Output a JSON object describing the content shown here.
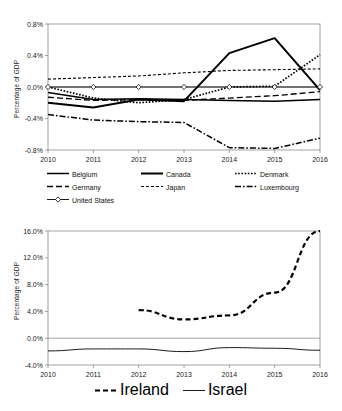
{
  "figure": {
    "background": "#ffffff",
    "line_color": "#000000",
    "axis_color": "#808080"
  },
  "charts": [
    {
      "id": "top",
      "ylabel": "Percentage of GDP",
      "yticks": [
        "0.8%",
        "0.4%",
        "0.0%",
        "-0.4%",
        "-0.8%"
      ],
      "xticks": [
        "2010",
        "2011",
        "2012",
        "2013",
        "2014",
        "2015",
        "2016"
      ],
      "legend": [
        {
          "label": "Belgium",
          "style": "solid"
        },
        {
          "label": "Canada",
          "style": "solid-thick"
        },
        {
          "label": "Denmark",
          "style": "dotted"
        },
        {
          "label": "Germany",
          "style": "dashed"
        },
        {
          "label": "Japan",
          "style": "fine-dashed"
        },
        {
          "label": "Luxembourg",
          "style": "dash-dot"
        },
        {
          "label": "United States",
          "style": "solid-marker"
        }
      ]
    },
    {
      "id": "bottom",
      "ylabel": "Percentage of GDP",
      "yticks": [
        "16.0%",
        "12.0%",
        "8.0%",
        "4.0%",
        "0.0%",
        "-4.0%"
      ],
      "xticks": [
        "2010",
        "2011",
        "2012",
        "2013",
        "2014",
        "2015",
        "2016"
      ],
      "legend": [
        {
          "label": "Ireland",
          "style": "heavy-dashed"
        },
        {
          "label": "Israel",
          "style": "thin-solid"
        }
      ]
    }
  ],
  "chart_data": [
    {
      "type": "line",
      "title": "",
      "xlabel": "",
      "ylabel": "Percentage of GDP",
      "x": [
        2010,
        2011,
        2012,
        2013,
        2014,
        2015,
        2016
      ],
      "xlim": [
        2010,
        2016
      ],
      "ylim": [
        -0.8,
        0.8
      ],
      "ytick_values": [
        0.8,
        0.4,
        0.0,
        -0.4,
        -0.8
      ],
      "ytick_labels": [
        "0.8%",
        "0.4%",
        "0.0%",
        "-0.4%",
        "-0.8%"
      ],
      "xtick_labels": [
        "2010",
        "2011",
        "2012",
        "2013",
        "2014",
        "2015",
        "2016"
      ],
      "grid": false,
      "legend_position": "below",
      "series": [
        {
          "name": "Belgium",
          "style": "solid",
          "values": [
            -0.07,
            -0.16,
            -0.15,
            -0.16,
            -0.17,
            -0.18,
            -0.16
          ]
        },
        {
          "name": "Canada",
          "style": "solid-thick",
          "values": [
            -0.2,
            -0.26,
            -0.16,
            -0.18,
            0.43,
            0.62,
            -0.04
          ]
        },
        {
          "name": "Denmark",
          "style": "dotted",
          "values": [
            0.0,
            -0.14,
            -0.2,
            -0.16,
            0.0,
            0.01,
            0.41
          ]
        },
        {
          "name": "Germany",
          "style": "dashed",
          "values": [
            -0.13,
            -0.17,
            -0.16,
            -0.17,
            -0.14,
            -0.11,
            -0.06
          ]
        },
        {
          "name": "Japan",
          "style": "fine-dashed",
          "values": [
            0.1,
            0.12,
            0.14,
            0.18,
            0.21,
            0.22,
            0.23
          ]
        },
        {
          "name": "Luxembourg",
          "style": "dash-dot",
          "values": [
            -0.35,
            -0.42,
            -0.44,
            -0.45,
            -0.77,
            -0.78,
            -0.65
          ]
        },
        {
          "name": "United States",
          "style": "solid-marker",
          "values": [
            0.0,
            0.0,
            0.0,
            0.0,
            0.0,
            0.0,
            0.0
          ]
        }
      ]
    },
    {
      "type": "line",
      "title": "",
      "xlabel": "",
      "ylabel": "Percentage of GDP",
      "x": [
        2010,
        2011,
        2012,
        2013,
        2014,
        2015,
        2016
      ],
      "xlim": [
        2010,
        2016
      ],
      "ylim": [
        -4.0,
        16.0
      ],
      "ytick_values": [
        16.0,
        12.0,
        8.0,
        4.0,
        0.0,
        -4.0
      ],
      "ytick_labels": [
        "16.0%",
        "12.0%",
        "8.0%",
        "4.0%",
        "0.0%",
        "-4.0%"
      ],
      "xtick_labels": [
        "2010",
        "2011",
        "2012",
        "2013",
        "2014",
        "2015",
        "2016"
      ],
      "grid": false,
      "legend_position": "below",
      "series": [
        {
          "name": "Ireland",
          "style": "heavy-dashed",
          "values": [
            null,
            null,
            4.2,
            2.8,
            3.4,
            6.8,
            16.0
          ]
        },
        {
          "name": "Israel",
          "style": "thin-solid",
          "values": [
            -1.9,
            -1.6,
            -1.6,
            -2.0,
            -1.4,
            -1.5,
            -1.8
          ]
        }
      ]
    }
  ]
}
